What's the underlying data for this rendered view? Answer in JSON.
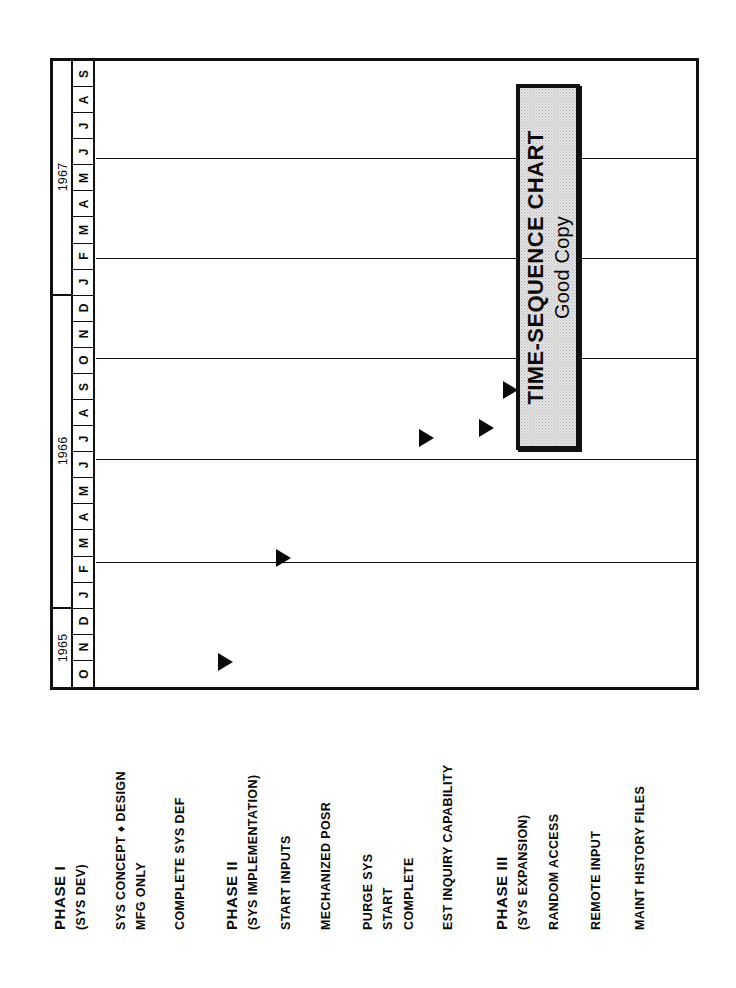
{
  "title_plate": {
    "line1": "TIME-SEQUENCE CHART",
    "line2": "Good Copy",
    "fill_color": "#e3e3e3",
    "border_color": "#111111"
  },
  "chart_data": {
    "type": "bar",
    "title": "TIME-SEQUENCE CHART",
    "subtitle": "Good Copy",
    "orientation": "rotated-90",
    "xlabel": "",
    "ylabel": "",
    "grid": true,
    "axis": {
      "years": [
        {
          "label": "1967",
          "months": [
            "J",
            "F",
            "M",
            "A",
            "M",
            "J",
            "J",
            "A",
            "S"
          ]
        },
        {
          "label": "1966",
          "months": [
            "J",
            "F",
            "M",
            "A",
            "M",
            "J",
            "J",
            "A",
            "S",
            "O",
            "N",
            "D"
          ]
        },
        {
          "label": "1965",
          "months": [
            "O",
            "N",
            "D"
          ]
        }
      ],
      "month_order_top_to_bottom": [
        "S",
        "A",
        "J",
        "J",
        "M",
        "A",
        "M",
        "F",
        "J",
        "D",
        "N",
        "O",
        "S",
        "A",
        "J",
        "J",
        "M",
        "A",
        "M",
        "F",
        "J",
        "D",
        "N",
        "O"
      ],
      "range_start": "1965-10",
      "range_end": "1967-09"
    },
    "categories": [
      "PHASE I",
      "(SYS DEV)",
      "SYS CONCEPT & DESIGN",
      "MFG ONLY",
      "COMPLETE SYS DEF",
      "PHASE II",
      "(SYS IMPLEMENTATION)",
      "START INPUTS",
      "MECHANIZED POSR",
      "PURGE SYS",
      "START",
      "COMPLETE",
      "EST INQUIRY CAPABILITY",
      "PHASE III",
      "(SYS EXPANSION)",
      "RANDOM ACCESS",
      "REMOTE INPUT",
      "MAINT HISTORY FILES"
    ],
    "milestones": [
      {
        "label": "SYS CONCEPT & DESIGN / MFG ONLY",
        "date": "1965-11",
        "marker": "filled-triangle"
      },
      {
        "label": "COMPLETE SYS DEF",
        "date": "1966-02",
        "marker": "filled-triangle"
      },
      {
        "label": "START INPUTS",
        "date": "1966-05",
        "marker": "filled-triangle"
      },
      {
        "label": "MECHANIZED POSR",
        "date": "1966-07",
        "marker": "filled-triangle"
      },
      {
        "label": "PURGE SYS START",
        "date": "1966-08",
        "marker": "filled-triangle"
      },
      {
        "label": "PURGE SYS COMPLETE",
        "date": "1966-10",
        "marker": "filled-triangle"
      },
      {
        "label": "EST INQUIRY CAPABILITY",
        "date": "1966-10",
        "marker": "filled-triangle"
      },
      {
        "label": "REMOTE INPUT",
        "date": "1967-06",
        "marker": "hollow-triangle"
      },
      {
        "label": "MAINT HISTORY FILES",
        "date": "1967-09",
        "marker": "hollow-triangle"
      }
    ]
  },
  "grid": {
    "row_separator_fractions": [
      0.155,
      0.315,
      0.475,
      0.635,
      0.8
    ],
    "band_labels": [
      "PHASE I band",
      "PHASE II band",
      "PHASE III band"
    ]
  },
  "labels": [
    {
      "text": "PHASE I",
      "x": 18,
      "style": "phase"
    },
    {
      "text": "(SYS DEV)",
      "x": 38,
      "style": "sub"
    },
    {
      "text": "SYS CONCEPT ♦ DESIGN",
      "x": 78,
      "style": "plain"
    },
    {
      "text": "MFG ONLY",
      "x": 98,
      "style": "plain"
    },
    {
      "text": "COMPLETE SYS DEF",
      "x": 137,
      "style": "plain"
    },
    {
      "text": "PHASE II",
      "x": 190,
      "style": "phase"
    },
    {
      "text": "(SYS IMPLEMENTATION)",
      "x": 210,
      "style": "sub"
    },
    {
      "text": "START INPUTS",
      "x": 243,
      "style": "plain"
    },
    {
      "text": "MECHANIZED POSR",
      "x": 283,
      "style": "plain"
    },
    {
      "text": "PURGE SYS",
      "x": 325,
      "style": "plain"
    },
    {
      "text": "START",
      "x": 345,
      "style": "plain"
    },
    {
      "text": "COMPLETE",
      "x": 366,
      "style": "plain"
    },
    {
      "text": "EST INQUIRY CAPABILITY",
      "x": 405,
      "style": "plain"
    },
    {
      "text": "PHASE III",
      "x": 460,
      "style": "phase"
    },
    {
      "text": "(SYS EXPANSION)",
      "x": 480,
      "style": "sub"
    },
    {
      "text": "RANDOM ACCESS",
      "x": 511,
      "style": "plain"
    },
    {
      "text": "REMOTE INPUT",
      "x": 553,
      "style": "plain"
    },
    {
      "text": "MAINT HISTORY FILES",
      "x": 597,
      "style": "plain"
    }
  ],
  "markers": [
    {
      "name": "milestone-sys-concept-design",
      "left": 122,
      "top": 592,
      "type": "filled"
    },
    {
      "name": "milestone-complete-sys-def",
      "left": 180,
      "top": 488,
      "type": "filled"
    },
    {
      "name": "milestone-start-inputs",
      "left": 323,
      "top": 368,
      "type": "filled"
    },
    {
      "name": "milestone-mechanized-posr",
      "left": 383,
      "top": 358,
      "type": "filled"
    },
    {
      "name": "milestone-purge-sys-start",
      "left": 407,
      "top": 320,
      "type": "filled"
    },
    {
      "name": "milestone-purge-sys-complete",
      "left": 440,
      "top": 330,
      "type": "filled"
    },
    {
      "name": "milestone-est-inquiry",
      "left": 466,
      "top": 260,
      "type": "filled"
    },
    {
      "name": "milestone-remote-input",
      "left": 602,
      "top": 100,
      "type": "hollow"
    },
    {
      "name": "milestone-maint-history",
      "left": 635,
      "top": 26,
      "type": "hollow"
    }
  ]
}
